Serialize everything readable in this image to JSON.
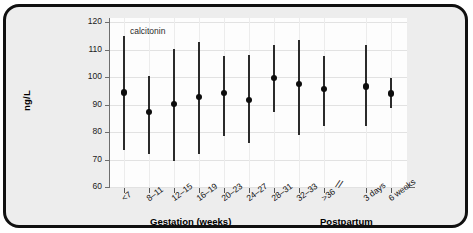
{
  "chart_data": {
    "type": "scatter",
    "title": "",
    "series_label": "calcitonin",
    "xlabel": "",
    "ylabel": "ng/L",
    "ylim": [
      60,
      120
    ],
    "ytick_values": [
      120,
      110,
      100,
      90,
      80,
      70,
      60
    ],
    "ytick_labels": [
      "120",
      "110",
      "100",
      "90",
      "80",
      "70",
      "60"
    ],
    "grid": true,
    "legend": "none",
    "group_labels": [
      "Gestation (weeks)",
      "Postpartum"
    ],
    "axis_break_marker": "//",
    "categories": [
      "<7",
      "8–11",
      "12–15",
      "16–19",
      "20–23",
      "24–27",
      "28–31",
      "32–33",
      ">36",
      "3 days",
      "6 weeks"
    ],
    "group_of_category": [
      "Gestation (weeks)",
      "Gestation (weeks)",
      "Gestation (weeks)",
      "Gestation (weeks)",
      "Gestation (weeks)",
      "Gestation (weeks)",
      "Gestation (weeks)",
      "Gestation (weeks)",
      "Gestation (weeks)",
      "Postpartum",
      "Postpartum"
    ],
    "values": [
      94.3,
      87.2,
      90.2,
      92.8,
      94.1,
      91.6,
      99.6,
      97.4,
      95.6,
      96.5,
      94.0
    ],
    "range_low": [
      73.3,
      72.1,
      69.6,
      71.9,
      78.5,
      76.1,
      87.3,
      79.0,
      82.0,
      82.3,
      88.8
    ],
    "range_high": [
      115.0,
      100.3,
      110.1,
      112.9,
      107.6,
      107.9,
      111.8,
      113.3,
      107.8,
      111.6,
      99.8
    ]
  }
}
